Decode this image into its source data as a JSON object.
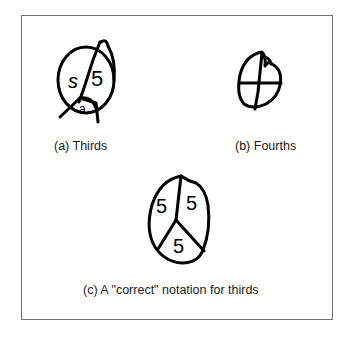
{
  "figure": {
    "panels": [
      {
        "id": "a",
        "caption": "(a) Thirds",
        "drawing": "circle-divided-thirds-incorrect",
        "labels": [
          "5",
          "5",
          "5"
        ]
      },
      {
        "id": "b",
        "caption": "(b) Fourths",
        "drawing": "circle-divided-fourths",
        "labels": []
      },
      {
        "id": "c",
        "caption": "(c) A \"correct\" notation for thirds",
        "drawing": "circle-divided-thirds-correct",
        "labels": [
          "5",
          "5",
          "5"
        ]
      }
    ],
    "stroke_color": "#000000",
    "frame_color": "#6e6e6e"
  }
}
